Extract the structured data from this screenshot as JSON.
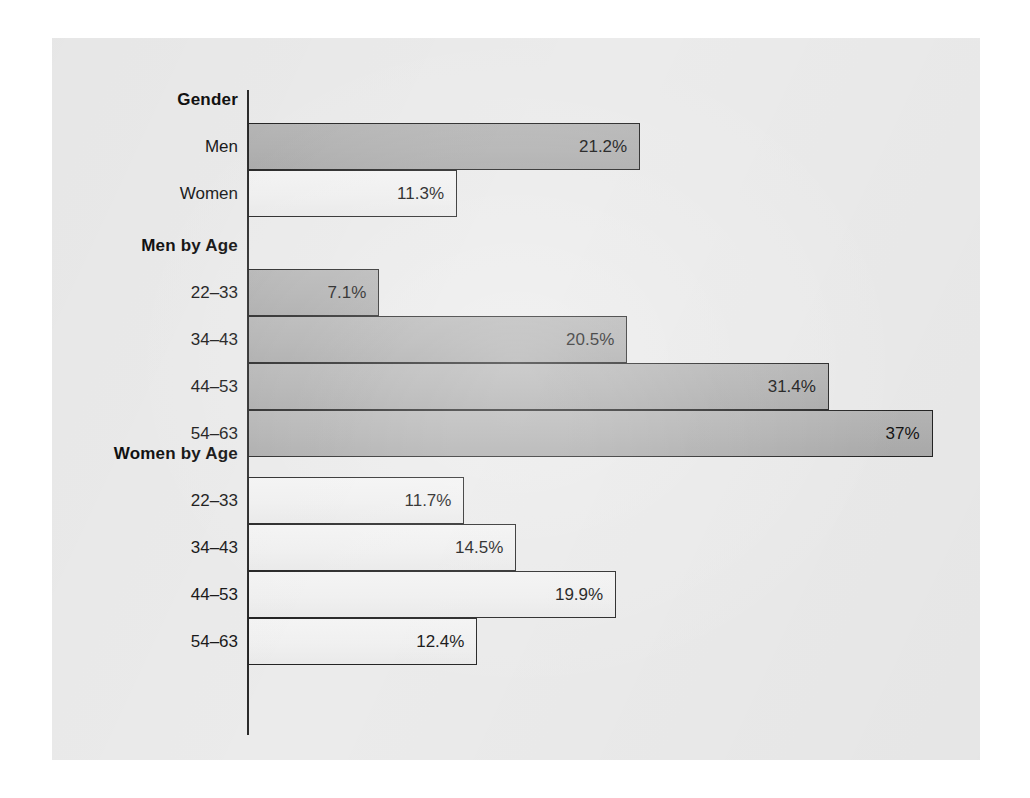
{
  "chart_data": {
    "type": "bar",
    "orientation": "horizontal",
    "title": "",
    "xlabel": "",
    "ylabel": "",
    "xlim": [
      0,
      37
    ],
    "grid": false,
    "legend": "none",
    "value_suffix": "%",
    "groups": [
      {
        "id": "gender",
        "title": "Gender",
        "series": "mixed",
        "categories": [
          "Men",
          "Women"
        ],
        "values": [
          21.2,
          11.3
        ],
        "labels": [
          "21.2%",
          "11.3%"
        ],
        "styles": [
          "men",
          "women"
        ]
      },
      {
        "id": "men-by-age",
        "title": "Men by Age",
        "series": "men",
        "categories": [
          "22–33",
          "34–43",
          "44–53",
          "54–63"
        ],
        "values": [
          7.1,
          20.5,
          31.4,
          37.0
        ],
        "labels": [
          "7.1%",
          "20.5%",
          "31.4%",
          "37%"
        ],
        "styles": [
          "men",
          "men",
          "men",
          "men"
        ]
      },
      {
        "id": "women-by-age",
        "title": "Women by Age",
        "series": "women",
        "categories": [
          "22–33",
          "34–43",
          "44–53",
          "54–63"
        ],
        "values": [
          11.7,
          14.5,
          19.9,
          12.4
        ],
        "labels": [
          "11.7%",
          "14.5%",
          "19.9%",
          "12.4%"
        ],
        "styles": [
          "women",
          "women",
          "women",
          "women"
        ]
      }
    ]
  },
  "colors": {
    "page_background": "#ffffff",
    "panel_background": "#ebebeb",
    "men_bar_fill": "#b1b1b1",
    "women_bar_fill": "#f0f0f0",
    "bar_outline": "#242424",
    "axis": "#2b2b2b",
    "text": "#141414"
  },
  "layout": {
    "axis_x_px": 196,
    "px_per_percent": 18.5,
    "bar_height_px": 47
  },
  "groups": {
    "gender": {
      "title": "Gender",
      "rows": [
        {
          "label": "Men",
          "value": "21.2%"
        },
        {
          "label": "Women",
          "value": "11.3%"
        }
      ]
    },
    "men_by_age": {
      "title": "Men by Age",
      "rows": [
        {
          "label": "22–33",
          "value": "7.1%"
        },
        {
          "label": "34–43",
          "value": "20.5%"
        },
        {
          "label": "44–53",
          "value": "31.4%"
        },
        {
          "label": "54–63",
          "value": "37%"
        }
      ]
    },
    "women_by_age": {
      "title": "Women by Age",
      "rows": [
        {
          "label": "22–33",
          "value": "11.7%"
        },
        {
          "label": "34–43",
          "value": "14.5%"
        },
        {
          "label": "44–53",
          "value": "19.9%"
        },
        {
          "label": "54–63",
          "value": "12.4%"
        }
      ]
    }
  }
}
